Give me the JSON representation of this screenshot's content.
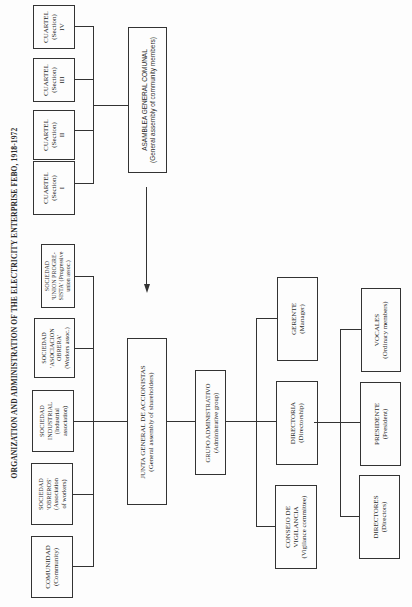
{
  "title": "ORGANIZATION AND ADMINISTRATION OF THE ELECTRICITY ENTERPRISE FEBO, 1918-1972",
  "nodes": {
    "cuartel_iv": {
      "lines": [
        "CUARTEL",
        "(Section)",
        "IV"
      ]
    },
    "cuartel_iii": {
      "lines": [
        "CUARTEL",
        "(Section)",
        "III"
      ]
    },
    "cuartel_ii": {
      "lines": [
        "CUARTEL",
        "(Section)",
        "II"
      ]
    },
    "cuartel_i": {
      "lines": [
        "CUARTEL",
        "(Section)",
        "I"
      ]
    },
    "asamblea": {
      "lines": [
        "ASAMBLEA GENERAL COMUNAL",
        "(General assembly of community members)"
      ]
    },
    "sociedad_union": {
      "lines": [
        "SOCIEDAD",
        "'UNION PROGRE-",
        "SISTA' (Progressive",
        "union assoc.)"
      ]
    },
    "sociedad_asociacion": {
      "lines": [
        "SOCIEDAD",
        "'ASOCIACION",
        "OBRERA'",
        "(Workers assoc.)"
      ]
    },
    "sociedad_industrial": {
      "lines": [
        "SOCIEDAD",
        "INDUSTRIAL",
        "(Industrial",
        "association)"
      ]
    },
    "sociedad_obreros": {
      "lines": [
        "SOCIEDAD",
        "'OBREROS'",
        "(Association",
        "of workers)"
      ]
    },
    "comunidad": {
      "lines": [
        "COMUNIDAD",
        "(Community)"
      ]
    },
    "junta": {
      "lines": [
        "JUNTA GENERAL DE ACCIONISTAS",
        "(General assembly of shareholders)"
      ]
    },
    "grupo": {
      "lines": [
        "GRUPO ADMINISTRATIVO",
        "(Administrative group)"
      ]
    },
    "gerente": {
      "lines": [
        "GERENTE",
        "(Manager)"
      ]
    },
    "directoria": {
      "lines": [
        "DIRECTORIA",
        "(Directorship)"
      ]
    },
    "consejo": {
      "lines": [
        "CONSEJO DE",
        "VIGILANCIA",
        "(Vigilance committee)"
      ]
    },
    "vocales": {
      "lines": [
        "VOCALES",
        "(Ordinary members)"
      ]
    },
    "presidente": {
      "lines": [
        "PRESIDENTE",
        "(President)"
      ]
    },
    "directores": {
      "lines": [
        "DIRECTORES",
        "(Directors)"
      ]
    }
  },
  "edges": [
    {
      "from": "cuartel_i",
      "to": "asamblea"
    },
    {
      "from": "cuartel_ii",
      "to": "asamblea"
    },
    {
      "from": "cuartel_iii",
      "to": "asamblea"
    },
    {
      "from": "cuartel_iv",
      "to": "asamblea"
    },
    {
      "from": "asamblea",
      "to": "junta",
      "type": "arrow"
    },
    {
      "from": "comunidad",
      "to": "junta"
    },
    {
      "from": "sociedad_obreros",
      "to": "junta"
    },
    {
      "from": "sociedad_industrial",
      "to": "junta"
    },
    {
      "from": "sociedad_asociacion",
      "to": "junta"
    },
    {
      "from": "sociedad_union",
      "to": "junta"
    },
    {
      "from": "junta",
      "to": "grupo"
    },
    {
      "from": "grupo",
      "to": "gerente"
    },
    {
      "from": "grupo",
      "to": "directoria"
    },
    {
      "from": "grupo",
      "to": "consejo"
    },
    {
      "from": "directoria",
      "to": "vocales"
    },
    {
      "from": "directoria",
      "to": "presidente"
    },
    {
      "from": "directoria",
      "to": "directores"
    }
  ]
}
